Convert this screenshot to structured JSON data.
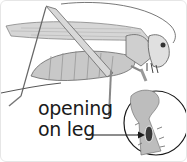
{
  "illustration": {
    "subject": "katydid",
    "style": "grayscale pencil illustration",
    "inset": "magnified leg showing opening"
  },
  "caption": {
    "line1": "opening",
    "line2": "on leg"
  },
  "colors": {
    "ink": "#1a1a1a",
    "shade": "#9a9a9a",
    "light": "#d4d4d4",
    "background": "#ffffff"
  }
}
